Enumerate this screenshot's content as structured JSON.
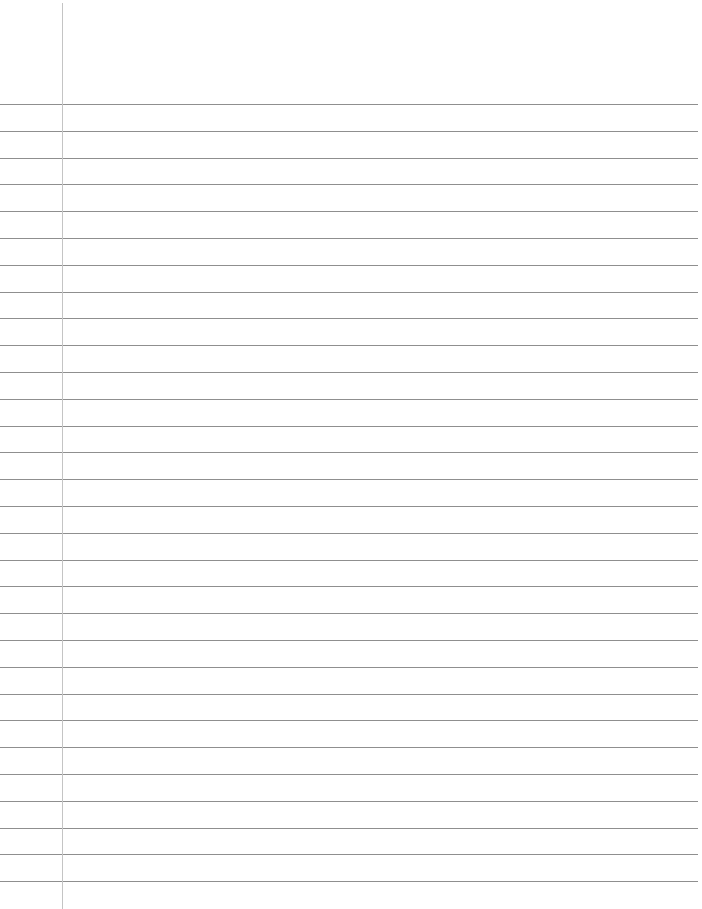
{
  "page": {
    "type": "ruled-notebook-paper",
    "background_color": "#ffffff",
    "rule_color": "#8f8f8f",
    "margin_line_color": "#c4c4c4",
    "margin_x": 62,
    "first_rule_y": 104,
    "rule_spacing": 26.8,
    "rule_count": 30
  }
}
